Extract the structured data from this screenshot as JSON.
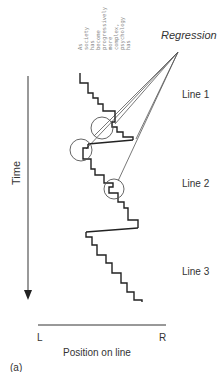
{
  "diagram": {
    "title": "",
    "panel_label": "(a)",
    "vertical_axis_label": "Time",
    "horizontal_axis_label": "Position on line",
    "horizontal_axis_left": "L",
    "horizontal_axis_right": "R",
    "annotation": "Regression",
    "line_labels": [
      "Line 1",
      "Line 2",
      "Line 3"
    ],
    "rotated_words": [
      "As",
      "society",
      "has",
      "become",
      "progressively",
      "more",
      "complex,",
      "psychology",
      "has"
    ],
    "colors": {
      "stroke": "#222222",
      "thin_stroke": "#555555",
      "text": "#333333",
      "faint_text": "#888888"
    }
  }
}
